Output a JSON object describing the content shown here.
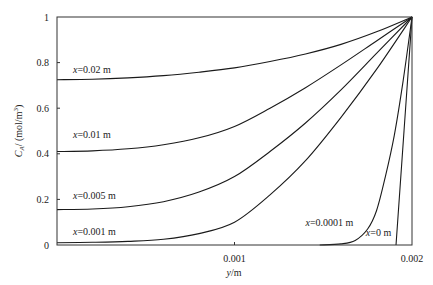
{
  "chart_data": {
    "type": "line",
    "title": "",
    "xlabel": "y/m",
    "ylabel": "C_A/ (mol/m^3)",
    "xlim": [
      0,
      0.002
    ],
    "ylim": [
      0,
      1
    ],
    "grid": false,
    "legend": "inline labels",
    "x_ticks": [
      {
        "value": 0.001,
        "label": "0.001"
      },
      {
        "value": 0.002,
        "label": "0.002"
      }
    ],
    "y_ticks": [
      {
        "value": 0,
        "label": "0"
      },
      {
        "value": 0.2,
        "label": "0.2"
      },
      {
        "value": 0.4,
        "label": "0.4"
      },
      {
        "value": 0.6,
        "label": "0.6"
      },
      {
        "value": 0.8,
        "label": "0.8"
      },
      {
        "value": 1,
        "label": "1"
      }
    ],
    "series": [
      {
        "name": "x=0.02 m",
        "label_x": "x",
        "label_rest": "=0.02 m",
        "label_pos": [
          9e-05,
          0.755
        ],
        "x": [
          0,
          0.0002,
          0.0004,
          0.0006,
          0.0008,
          0.001,
          0.0012,
          0.0014,
          0.0016,
          0.0018,
          0.002
        ],
        "y": [
          0.725,
          0.727,
          0.733,
          0.743,
          0.758,
          0.777,
          0.805,
          0.838,
          0.88,
          0.935,
          1.0
        ]
      },
      {
        "name": "x=0.01 m",
        "label_x": "x",
        "label_rest": "=0.01 m",
        "label_pos": [
          9e-05,
          0.47
        ],
        "x": [
          0,
          0.0002,
          0.0004,
          0.0006,
          0.0008,
          0.001,
          0.0012,
          0.0014,
          0.0016,
          0.0018,
          0.002
        ],
        "y": [
          0.41,
          0.413,
          0.422,
          0.44,
          0.47,
          0.52,
          0.6,
          0.69,
          0.79,
          0.895,
          1.0
        ]
      },
      {
        "name": "x=0.005 m",
        "label_x": "x",
        "label_rest": "=0.005 m",
        "label_pos": [
          9e-05,
          0.2
        ],
        "x": [
          0,
          0.0002,
          0.0004,
          0.0006,
          0.0008,
          0.001,
          0.0012,
          0.0014,
          0.0016,
          0.0018,
          0.002
        ],
        "y": [
          0.155,
          0.158,
          0.168,
          0.19,
          0.232,
          0.3,
          0.41,
          0.535,
          0.68,
          0.84,
          1.0
        ]
      },
      {
        "name": "x=0.001 m",
        "label_x": "x",
        "label_rest": "=0.001 m",
        "label_pos": [
          9e-05,
          0.045
        ],
        "x": [
          0,
          0.0002,
          0.0004,
          0.0006,
          0.0008,
          0.001,
          0.0012,
          0.0014,
          0.0016,
          0.0018,
          0.002
        ],
        "y": [
          0.01,
          0.012,
          0.016,
          0.025,
          0.05,
          0.1,
          0.22,
          0.37,
          0.56,
          0.77,
          1.0
        ]
      },
      {
        "name": "x=0.0001 m",
        "label_x": "x",
        "label_rest": "=0.0001 m",
        "label_pos": [
          0.0014,
          0.085
        ],
        "x": [
          0.00148,
          0.0016,
          0.00168,
          0.00175,
          0.0018,
          0.00185,
          0.0019,
          0.00195,
          0.002
        ],
        "y": [
          0.0,
          0.005,
          0.02,
          0.07,
          0.15,
          0.3,
          0.48,
          0.72,
          1.0
        ]
      },
      {
        "name": "x=0 m",
        "label_x": "x",
        "label_rest": "=0 m",
        "label_pos": [
          0.00174,
          0.04
        ],
        "x": [
          0.00191,
          0.002
        ],
        "y": [
          0.0,
          1.0
        ]
      }
    ]
  },
  "axes": {
    "x_title_italic": "y",
    "x_title_rest": "/m",
    "y_title_c": "C",
    "y_title_sub": "A",
    "y_title_rest": "/ (mol/m",
    "y_title_sup": "3",
    "y_title_close": ")"
  }
}
